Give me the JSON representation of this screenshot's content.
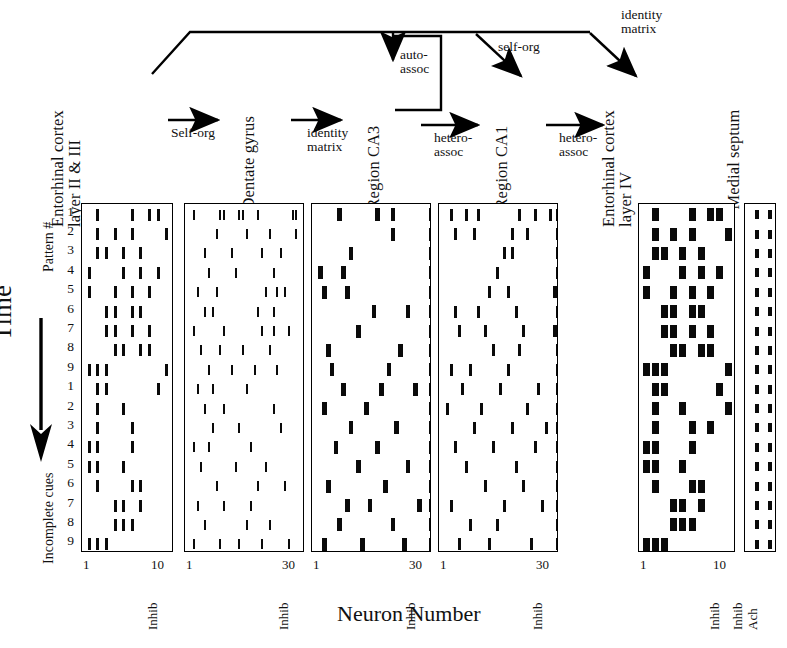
{
  "figure": {
    "x_axis_title": "Neuron Number",
    "time_label": "Time",
    "group_labels": {
      "top": "Pattern #",
      "bottom": "Incomplete cues"
    },
    "row_numbers": [
      "1",
      "2",
      "3",
      "4",
      "5",
      "6",
      "7",
      "8",
      "9",
      "1",
      "2",
      "3",
      "4",
      "5",
      "6",
      "7",
      "8",
      "9"
    ],
    "ink_color": "#0a0a0a"
  },
  "flow": {
    "nodes": [
      {
        "id": "ec23",
        "label_lines": [
          "Entorhinal cortex",
          "layer II & III"
        ]
      },
      {
        "id": "dg",
        "label_lines": [
          "Dentate gyrus"
        ]
      },
      {
        "id": "ca3",
        "label_lines": [
          "Region CA3"
        ]
      },
      {
        "id": "ca1",
        "label_lines": [
          "Region CA1"
        ]
      },
      {
        "id": "ec4",
        "label_lines": [
          "Entorhinal cortex",
          "layer IV"
        ]
      },
      {
        "id": "ms",
        "label_lines": [
          "Medial septum"
        ]
      }
    ],
    "arrows": [
      {
        "id": "ec23-to-dg",
        "label_lines": [
          "Self-org"
        ]
      },
      {
        "id": "dg-to-ca3",
        "label_lines": [
          "identity",
          "matrix"
        ]
      },
      {
        "id": "ca3-recurrent",
        "label_lines": [
          "auto-",
          "assoc"
        ]
      },
      {
        "id": "ca3-to-ca1",
        "label_lines": [
          "hetero-",
          "assoc"
        ]
      },
      {
        "id": "ca1-to-ec4",
        "label_lines": [
          "hetero-",
          "assoc"
        ]
      },
      {
        "id": "ec23-to-ca1",
        "label_lines": [
          "self-org"
        ]
      },
      {
        "id": "ec23-to-ec4",
        "label_lines": [
          "identity",
          "matrix"
        ]
      }
    ]
  },
  "chart_data": {
    "type": "raster",
    "xlabel": "Neuron Number",
    "ylabel": "Time",
    "row_count": 18,
    "row_groups": [
      {
        "name": "Pattern #",
        "rows": 9
      },
      {
        "name": "Incomplete cues",
        "rows": 9
      }
    ],
    "panels": [
      {
        "id": "ec23",
        "region": "Entorhinal cortex layer II & III",
        "neuron_count": 10,
        "x_ticks": [
          {
            "value": 1,
            "label": "1"
          },
          {
            "value": 10,
            "label": "10"
          }
        ],
        "extra_columns": [
          "Inhib"
        ],
        "mark_style": "medium",
        "rows": [
          [
            1,
            5,
            7,
            8,
            10
          ],
          [
            1,
            3,
            5,
            9,
            10
          ],
          [
            1,
            2,
            4,
            6,
            10
          ],
          [
            0,
            4,
            6,
            8,
            10
          ],
          [
            0,
            3,
            5,
            7,
            10
          ],
          [
            2,
            3,
            5,
            6,
            10
          ],
          [
            2,
            3,
            5,
            7,
            10
          ],
          [
            3,
            4,
            6,
            7,
            10
          ],
          [
            0,
            1,
            2,
            9,
            10
          ],
          [
            1,
            2,
            8,
            10
          ],
          [
            1,
            4,
            10
          ],
          [
            1,
            5,
            10
          ],
          [
            0,
            1,
            5,
            10
          ],
          [
            0,
            1,
            4,
            10
          ],
          [
            1,
            5,
            6,
            10
          ],
          [
            3,
            4,
            6,
            10
          ],
          [
            3,
            4,
            5,
            10
          ],
          [
            0,
            1,
            2,
            10
          ]
        ]
      },
      {
        "id": "dg",
        "region": "Dentate gyrus",
        "neuron_count": 30,
        "x_ticks": [
          {
            "value": 1,
            "label": "1"
          },
          {
            "value": 30,
            "label": "30"
          }
        ],
        "extra_columns": [
          "Inhib"
        ],
        "mark_style": "thin",
        "rows": [
          [
            1,
            8,
            9,
            13,
            14,
            18,
            27,
            28,
            30
          ],
          [
            7,
            15,
            21,
            28,
            30
          ],
          [
            4,
            11,
            19,
            24,
            30
          ],
          [
            5,
            12,
            22,
            30
          ],
          [
            2,
            7,
            20,
            23,
            25,
            30
          ],
          [
            4,
            6,
            18,
            22,
            30
          ],
          [
            1,
            9,
            19,
            22,
            26,
            30
          ],
          [
            3,
            8,
            14,
            21,
            30
          ],
          [
            5,
            11,
            17,
            23,
            30
          ],
          [
            2,
            6,
            15,
            30
          ],
          [
            4,
            9,
            22,
            30
          ],
          [
            6,
            13,
            24,
            30
          ],
          [
            1,
            5,
            16,
            30
          ],
          [
            3,
            12,
            20,
            30
          ],
          [
            7,
            18,
            25,
            30
          ],
          [
            2,
            9,
            16,
            30
          ],
          [
            4,
            15,
            21,
            30
          ],
          [
            1,
            8,
            13,
            19,
            26,
            30
          ]
        ]
      },
      {
        "id": "ca3",
        "region": "Region CA3",
        "neuron_count": 30,
        "x_ticks": [
          {
            "value": 1,
            "label": "1"
          },
          {
            "value": 30,
            "label": "30"
          }
        ],
        "extra_columns": [
          "Inhib"
        ],
        "mark_style": "bold",
        "rows": [
          [
            6,
            16,
            20,
            30
          ],
          [
            20,
            30
          ],
          [
            9,
            30
          ],
          [
            1,
            7,
            30
          ],
          [
            2,
            8,
            30
          ],
          [
            15,
            24,
            30
          ],
          [
            11,
            30
          ],
          [
            3,
            22,
            30
          ],
          [
            4,
            19,
            30
          ],
          [
            7,
            17,
            26,
            30
          ],
          [
            2,
            13,
            30
          ],
          [
            9,
            21,
            30
          ],
          [
            5,
            16,
            30
          ],
          [
            11,
            24,
            30
          ],
          [
            3,
            18,
            30
          ],
          [
            8,
            14,
            27,
            30
          ],
          [
            6,
            20,
            30
          ],
          [
            2,
            12,
            23,
            30
          ]
        ]
      },
      {
        "id": "ca1",
        "region": "Region CA1",
        "neuron_count": 30,
        "x_ticks": [
          {
            "value": 1,
            "label": "1"
          },
          {
            "value": 30,
            "label": "30"
          }
        ],
        "extra_columns": [
          "Inhib"
        ],
        "mark_style": "medium",
        "rows": [
          [
            2,
            6,
            9,
            20,
            24,
            28,
            30
          ],
          [
            3,
            8,
            18,
            22,
            30
          ],
          [
            16,
            18,
            30
          ],
          [
            14,
            30
          ],
          [
            12,
            17,
            29,
            30
          ],
          [
            3,
            9,
            19,
            30
          ],
          [
            4,
            11,
            21,
            29,
            30
          ],
          [
            13,
            20,
            30
          ],
          [
            2,
            7,
            17,
            30
          ],
          [
            5,
            15,
            25,
            30
          ],
          [
            1,
            10,
            22,
            30
          ],
          [
            8,
            18,
            27,
            30
          ],
          [
            3,
            13,
            24,
            30
          ],
          [
            6,
            19,
            30
          ],
          [
            11,
            21,
            30
          ],
          [
            2,
            16,
            26,
            30
          ],
          [
            7,
            14,
            30
          ],
          [
            4,
            12,
            23,
            30
          ]
        ]
      },
      {
        "id": "ec4",
        "region": "Entorhinal cortex layer IV",
        "neuron_count": 10,
        "x_ticks": [
          {
            "value": 1,
            "label": "1"
          },
          {
            "value": 10,
            "label": "10"
          }
        ],
        "extra_columns": [
          "Inhib"
        ],
        "mark_style": "thick",
        "rows": [
          [
            1,
            5,
            7,
            8,
            10
          ],
          [
            1,
            3,
            5,
            9,
            10
          ],
          [
            1,
            2,
            4,
            6,
            10
          ],
          [
            0,
            4,
            6,
            8,
            10
          ],
          [
            0,
            3,
            5,
            7,
            10
          ],
          [
            2,
            3,
            5,
            6,
            10
          ],
          [
            2,
            3,
            5,
            7,
            10
          ],
          [
            3,
            4,
            6,
            7,
            10
          ],
          [
            0,
            1,
            2,
            9,
            10
          ],
          [
            1,
            2,
            8,
            10
          ],
          [
            1,
            4,
            9,
            10
          ],
          [
            1,
            5,
            7,
            10
          ],
          [
            0,
            1,
            5,
            10
          ],
          [
            0,
            1,
            4,
            10
          ],
          [
            1,
            5,
            6,
            10
          ],
          [
            3,
            4,
            6,
            10
          ],
          [
            3,
            4,
            5,
            10
          ],
          [
            0,
            1,
            2,
            10
          ]
        ]
      },
      {
        "id": "ms",
        "region": "Medial septum",
        "neuron_count": 2,
        "x_ticks": [],
        "extra_columns": [
          "Inhib",
          "Ach"
        ],
        "mark_style": "dash",
        "rows": [
          [
            0,
            1
          ],
          [
            0,
            1
          ],
          [
            0,
            1
          ],
          [
            0,
            1
          ],
          [
            0,
            1
          ],
          [
            0,
            1
          ],
          [
            0,
            1
          ],
          [
            0,
            1
          ],
          [
            0,
            1
          ],
          [
            0,
            1
          ],
          [
            0,
            1
          ],
          [
            0,
            1
          ],
          [
            0,
            1
          ],
          [
            0,
            1
          ],
          [
            0,
            1
          ],
          [
            0,
            1
          ],
          [
            0,
            1
          ],
          [
            0,
            1
          ]
        ]
      }
    ]
  }
}
